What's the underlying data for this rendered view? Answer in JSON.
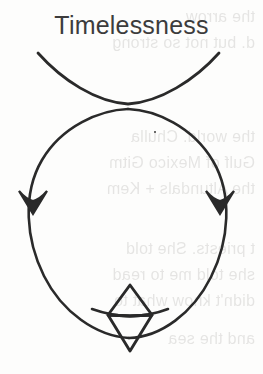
{
  "canvas": {
    "width": 263,
    "height": 374,
    "paper_color": "#fdfdfc",
    "ink_color": "#2a2a2a",
    "title_color": "#3c3c3c",
    "bleed_color": "#6d6a66"
  },
  "title": {
    "text": "Timelessness"
  },
  "diagram": {
    "type": "hand-drawn-symbol",
    "circle": {
      "cx": 128,
      "cy": 207,
      "r": 98
    },
    "cusp_arc": {
      "start_x": 38,
      "start_y": 53,
      "end_x": 218,
      "end_y": 53,
      "meet_x": 128,
      "meet_y": 103
    },
    "arrows": [
      {
        "name": "left-arrowhead",
        "x": 33,
        "y": 205,
        "direction": "down"
      },
      {
        "name": "right-arrowhead",
        "x": 219,
        "y": 205,
        "direction": "down"
      }
    ],
    "diamond": {
      "cx": 130,
      "top_y": 285,
      "bottom_y": 351,
      "half_width": 22,
      "midline_y": 314
    }
  },
  "background_text": {
    "note": "faint mirrored bleed-through handwriting from reverse side",
    "lines": [
      {
        "top": 8,
        "text": "the      arrow"
      },
      {
        "top": 34,
        "text": "d. but not so strong"
      },
      {
        "top": 128,
        "text": "the world. Chulla"
      },
      {
        "top": 154,
        "text": "Gulf of Mexico Gitm"
      },
      {
        "top": 180,
        "text": "the Altundals + Kem"
      },
      {
        "top": 240,
        "text": "t priests. She told"
      },
      {
        "top": 266,
        "text": "she told me to read"
      },
      {
        "top": 292,
        "text": "didn't know what to"
      },
      {
        "top": 330,
        "text": "and  the    sea"
      }
    ]
  }
}
